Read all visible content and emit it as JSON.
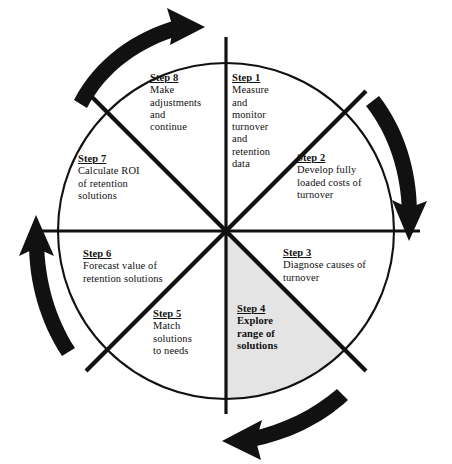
{
  "diagram": {
    "type": "cycle-wheel",
    "direction": "clockwise",
    "sector_count": 8,
    "colors": {
      "background": "#ffffff",
      "stroke": "#111111",
      "text": "#111111",
      "highlight_fill": "#e4e4e4",
      "arrow": "#111111"
    },
    "steps": [
      {
        "id": "step-1",
        "title": "Step  1",
        "body": "Measure\nand\nmonitor\nturnover\nand\nretention\ndata",
        "highlighted": false
      },
      {
        "id": "step-2",
        "title": "Step 2",
        "body": "Develop fully\nloaded costs of\nturnover",
        "highlighted": false
      },
      {
        "id": "step-3",
        "title": "Step 3",
        "body": "Diagnose causes of\nturnover",
        "highlighted": false
      },
      {
        "id": "step-4",
        "title": "Step 4",
        "body": "Explore\nrange of\nsolutions",
        "highlighted": true
      },
      {
        "id": "step-5",
        "title": "Step 5",
        "body": "Match\nsolutions\nto needs",
        "highlighted": false
      },
      {
        "id": "step-6",
        "title": "Step 6",
        "body": "Forecast value of\nretention solutions",
        "highlighted": false
      },
      {
        "id": "step-7",
        "title": "Step 7",
        "body": "Calculate ROI\nof retention\nsolutions",
        "highlighted": false
      },
      {
        "id": "step-8",
        "title": "Step 8",
        "body": "Make\nadjustments\nand\ncontinue",
        "highlighted": false
      }
    ],
    "arrows": [
      {
        "id": "arrow-top-left",
        "points": "up-right",
        "position": "outside top-left"
      },
      {
        "id": "arrow-right",
        "points": "down",
        "position": "outside right"
      },
      {
        "id": "arrow-bottom-right",
        "points": "left",
        "position": "outside bottom"
      },
      {
        "id": "arrow-left",
        "points": "up",
        "position": "outside left"
      }
    ]
  }
}
